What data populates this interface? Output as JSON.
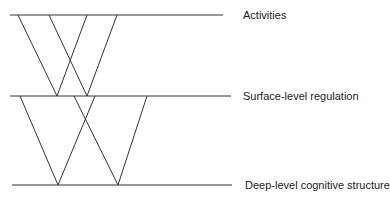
{
  "diagram": {
    "levels": [
      {
        "label": "Activities",
        "y": 15,
        "x1": 10,
        "x2": 223,
        "label_x": 243,
        "label_y": 10
      },
      {
        "label": "Surface-level regulation",
        "y": 96,
        "x1": 10,
        "x2": 231,
        "label_x": 243,
        "label_y": 91
      },
      {
        "label": "Deep-level cognitive structure",
        "y": 185,
        "x1": 12,
        "x2": 232,
        "label_x": 245,
        "label_y": 180
      }
    ],
    "upper_vs": [
      {
        "left_top_x": 18,
        "right_top_x": 87,
        "bottom_x": 57
      },
      {
        "left_top_x": 49,
        "right_top_x": 117,
        "bottom_x": 87
      }
    ],
    "lower_vs": [
      {
        "left_top_x": 20,
        "right_top_x": 95,
        "bottom_x": 58
      },
      {
        "left_top_x": 74,
        "right_top_x": 147,
        "bottom_x": 118
      }
    ],
    "line_color": "#333333"
  }
}
